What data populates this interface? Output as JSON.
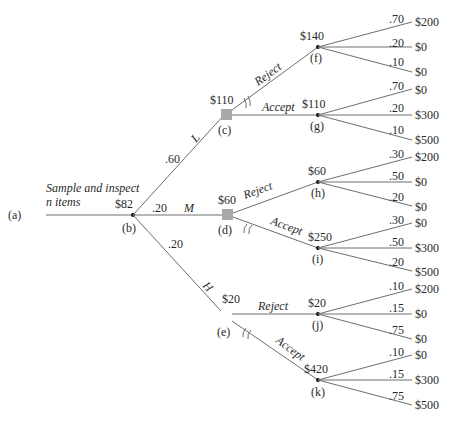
{
  "tree": {
    "root": {
      "id": "(a)",
      "label": "Sample and inspect",
      "label2": "n items"
    },
    "b": {
      "id": "(b)",
      "value": "$82"
    },
    "branches_b": [
      {
        "state": "L",
        "prob": ".60"
      },
      {
        "state": "M",
        "prob": ".20"
      },
      {
        "state": "H",
        "prob": ".20"
      }
    ],
    "c": {
      "id": "(c)",
      "value": "$110",
      "reject": "Reject",
      "accept": "Accept"
    },
    "d": {
      "id": "(d)",
      "value": "$60",
      "reject": "Reject",
      "accept": "Accept"
    },
    "e": {
      "id": "(e)",
      "value": "$20",
      "reject": "Reject",
      "accept": "Accept"
    },
    "f": {
      "id": "(f)",
      "value": "$140",
      "outcomes": [
        {
          "p": ".70",
          "v": "$200"
        },
        {
          "p": ".20",
          "v": "$0"
        },
        {
          "p": ".10",
          "v": "$0"
        }
      ]
    },
    "g": {
      "id": "(g)",
      "value": "$110",
      "outcomes": [
        {
          "p": ".70",
          "v": "$0"
        },
        {
          "p": ".20",
          "v": "$300"
        },
        {
          "p": ".10",
          "v": "$500"
        }
      ]
    },
    "h": {
      "id": "(h)",
      "value": "$60",
      "outcomes": [
        {
          "p": ".30",
          "v": "$200"
        },
        {
          "p": ".50",
          "v": "$0"
        },
        {
          "p": ".20",
          "v": "$0"
        }
      ]
    },
    "i": {
      "id": "(i)",
      "value": "$250",
      "outcomes": [
        {
          "p": ".30",
          "v": "$0"
        },
        {
          "p": ".50",
          "v": "$300"
        },
        {
          "p": ".20",
          "v": "$500"
        }
      ]
    },
    "j": {
      "id": "(j)",
      "value": "$20",
      "outcomes": [
        {
          "p": ".10",
          "v": "$200"
        },
        {
          "p": ".15",
          "v": "$0"
        },
        {
          "p": ".75",
          "v": "$0"
        }
      ]
    },
    "k": {
      "id": "(k)",
      "value": "$420",
      "outcomes": [
        {
          "p": ".10",
          "v": "$0"
        },
        {
          "p": ".15",
          "v": "$300"
        },
        {
          "p": ".75",
          "v": "$500"
        }
      ]
    }
  }
}
